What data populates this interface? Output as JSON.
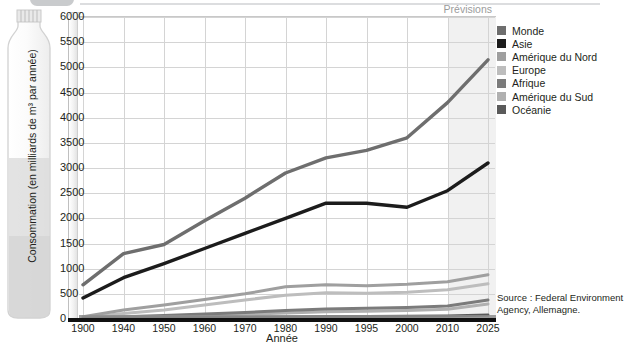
{
  "header": {
    "strip_visible": true
  },
  "axes": {
    "ylabel": "Consommation (en milliards de m³ par année)",
    "xlabel": "Année",
    "yticks": [
      0,
      500,
      1000,
      1500,
      2000,
      2500,
      3000,
      3500,
      4000,
      4500,
      5000,
      5500,
      6000
    ],
    "xticks": [
      "1900",
      "1940",
      "1950",
      "1960",
      "1970",
      "1980",
      "1990",
      "1995",
      "2000",
      "2010",
      "2025"
    ]
  },
  "annotations": {
    "forecast_label": "Prévisions",
    "forecast_start_year": "2010"
  },
  "legend": {
    "items": [
      {
        "label": "Monde",
        "color": "#6e6e6e"
      },
      {
        "label": "Asie",
        "color": "#1c1c1c"
      },
      {
        "label": "Amérique du Nord",
        "color": "#9f9f9f"
      },
      {
        "label": "Europe",
        "color": "#bdbdbd"
      },
      {
        "label": "Afrique",
        "color": "#7b7b7b"
      },
      {
        "label": "Amérique du Sud",
        "color": "#b0b0b0"
      },
      {
        "label": "Océanie",
        "color": "#5a5a5a"
      }
    ]
  },
  "source": {
    "line1": "Source : Federal Environment",
    "line2": "Agency, Allemagne."
  },
  "chart_data": {
    "type": "line",
    "title": "",
    "xlabel": "Année",
    "ylabel": "Consommation (en milliards de m³ par année)",
    "x": [
      "1900",
      "1940",
      "1950",
      "1960",
      "1970",
      "1980",
      "1990",
      "1995",
      "2000",
      "2010",
      "2025"
    ],
    "ylim": [
      0,
      6000
    ],
    "ytick_step": 500,
    "grid": true,
    "legend_position": "right",
    "forecast_region": {
      "from": "2010",
      "to": "2025",
      "label": "Prévisions"
    },
    "series": [
      {
        "name": "Monde",
        "color": "#6e6e6e",
        "values": [
          680,
          1300,
          1480,
          1950,
          2400,
          2900,
          3200,
          3350,
          3600,
          4300,
          5150
        ]
      },
      {
        "name": "Asie",
        "color": "#1c1c1c",
        "values": [
          420,
          820,
          1100,
          1400,
          1700,
          2000,
          2300,
          2300,
          2220,
          2550,
          3100
        ]
      },
      {
        "name": "Amérique du Nord",
        "color": "#9f9f9f",
        "values": [
          45,
          180,
          280,
          390,
          500,
          640,
          680,
          660,
          690,
          740,
          880
        ]
      },
      {
        "name": "Europe",
        "color": "#bdbdbd",
        "values": [
          30,
          110,
          180,
          280,
          380,
          470,
          520,
          510,
          530,
          580,
          700
        ]
      },
      {
        "name": "Afrique",
        "color": "#7b7b7b",
        "values": [
          15,
          45,
          70,
          100,
          130,
          170,
          200,
          215,
          230,
          260,
          380
        ]
      },
      {
        "name": "Amérique du Sud",
        "color": "#b0b0b0",
        "values": [
          10,
          30,
          48,
          70,
          95,
          120,
          145,
          155,
          170,
          195,
          300
        ]
      },
      {
        "name": "Océanie",
        "color": "#5a5a5a",
        "values": [
          5,
          12,
          18,
          25,
          32,
          40,
          48,
          52,
          56,
          62,
          80
        ]
      }
    ]
  }
}
